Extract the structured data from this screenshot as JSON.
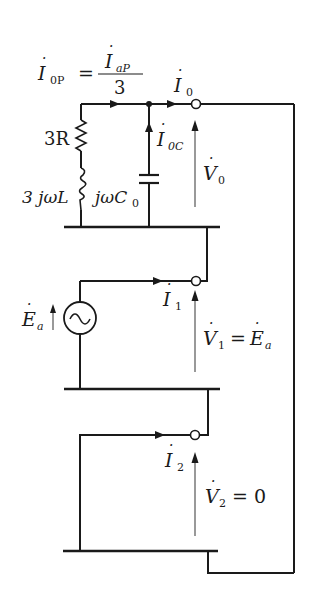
{
  "diagram": {
    "type": "zero-sequence equivalent circuit",
    "colors": {
      "line": "#1a1a1a",
      "arrow_thin": "#555555",
      "background": "#ffffff"
    },
    "top_equation": {
      "lhs_symbol": "I",
      "lhs_sub": "0P",
      "equals": "=",
      "num_symbol": "I",
      "num_sub": "aP",
      "den": "3"
    },
    "labels": {
      "i0": {
        "symbol": "I",
        "sub": "0"
      },
      "i0c": {
        "symbol": "I",
        "sub": "0C"
      },
      "v0": {
        "symbol": "V",
        "sub": "0"
      },
      "r": "3R",
      "l": "3 jωL",
      "c": {
        "prefix": "jωC",
        "sub": "0"
      },
      "ea": {
        "symbol": "E",
        "sub": "a"
      },
      "i1": {
        "symbol": "I",
        "sub": "1"
      },
      "v1": {
        "symbol": "V",
        "sub": "1",
        "eq": "=",
        "rhs_symbol": "E",
        "rhs_sub": "a"
      },
      "i2": {
        "symbol": "I",
        "sub": "2"
      },
      "v2": {
        "symbol": "V",
        "sub": "2",
        "eq": "= 0"
      }
    }
  }
}
